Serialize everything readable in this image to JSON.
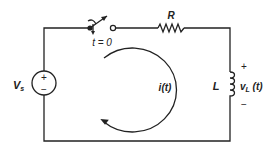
{
  "diagram": {
    "type": "RL series circuit with switch",
    "colors": {
      "line": "#222222",
      "background": "#ffffff"
    },
    "source": {
      "label_main": "V",
      "label_sub": "s",
      "plus": "+",
      "minus": "−"
    },
    "switch": {
      "label": "t = 0"
    },
    "resistor": {
      "label": "R"
    },
    "inductor": {
      "label": "L",
      "voltage_main": "v",
      "voltage_sub": "L",
      "voltage_arg": " (t)",
      "plus": "+",
      "minus": "−"
    },
    "current": {
      "label": "i(t)",
      "direction": "clockwise"
    }
  }
}
